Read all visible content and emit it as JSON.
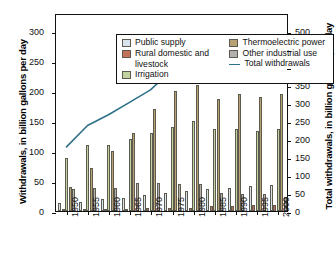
{
  "chart_data": {
    "type": "bar",
    "title": "",
    "subtitle": "",
    "xlabel": "",
    "ylabel": "Withdrawals, in billion gallons per day",
    "y2label": "Total withdrawals, in billion gallons per day",
    "categories": [
      "1950",
      "1955",
      "1960",
      "1965",
      "1970",
      "1975",
      "1980",
      "1985",
      "1990",
      "1995",
      "2000"
    ],
    "ylim": [
      0,
      330
    ],
    "y2lim": [
      0,
      550
    ],
    "yticks": [
      0,
      50,
      100,
      150,
      200,
      250,
      300
    ],
    "y2ticks": [
      0,
      50,
      100,
      150,
      200,
      250,
      300,
      350,
      400,
      450,
      500
    ],
    "grid": false,
    "legend_position": "top-inside",
    "series": [
      {
        "name": "Public supply",
        "color": "#d9e3ec",
        "axis": "left",
        "values": [
          14,
          15,
          20,
          22,
          27,
          30,
          34,
          37,
          39,
          42,
          44
        ]
      },
      {
        "name": "Rural domestic and livestock",
        "color": "#c4715c",
        "axis": "left",
        "values": [
          3.6,
          3.6,
          3.6,
          4.0,
          4.5,
          4.9,
          5.6,
          7.8,
          7.9,
          9.4,
          9.5
        ]
      },
      {
        "name": "Irrigation",
        "color": "#c3d3a0",
        "axis": "left",
        "values": [
          89,
          110,
          110,
          120,
          130,
          140,
          150,
          137,
          137,
          134,
          137
        ]
      },
      {
        "name": "Thermoelectric power",
        "color": "#b8a273",
        "axis": "left",
        "values": [
          40,
          72,
          100,
          130,
          170,
          200,
          210,
          187,
          195,
          190,
          195
        ]
      },
      {
        "name": "Other industrial use",
        "color": "#b3b0ad",
        "axis": "left",
        "values": [
          37,
          39,
          38,
          46,
          47,
          45,
          45,
          30,
          29,
          29,
          23
        ]
      }
    ],
    "line_series": {
      "name": "Total withdrawals",
      "color": "#2f7188",
      "axis": "right",
      "values": [
        180,
        240,
        270,
        305,
        340,
        395,
        440,
        399,
        408,
        399,
        408
      ]
    }
  },
  "legend": {
    "items": [
      {
        "label": "Public supply",
        "icon": "swatch-public-supply"
      },
      {
        "label": "Rural domestic and",
        "label_cont": "livestock",
        "icon": "swatch-rural-domestic"
      },
      {
        "label": "Irrigation",
        "icon": "swatch-irrigation"
      },
      {
        "label": "Thermoelectric power",
        "icon": "swatch-thermoelectric"
      },
      {
        "label": "Other industrial use",
        "icon": "swatch-other-industrial"
      },
      {
        "label": "Total withdrawals",
        "icon": "line-total-withdrawals"
      }
    ]
  }
}
